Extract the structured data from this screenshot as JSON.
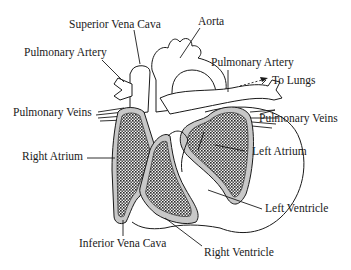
{
  "diagram": {
    "labels": {
      "superior_vena_cava": "Superior Vena Cava",
      "aorta": "Aorta",
      "pulmonary_artery_left": "Pulmonary Artery",
      "pulmonary_artery_right": "Pulmonary Artery",
      "to_lungs": "To Lungs",
      "pulmonary_veins_left": "Pulmonary Veins",
      "pulmonary_veins_right": "Pulmonary Veins",
      "right_atrium": "Right Atrium",
      "left_atrium": "Left Atrium",
      "left_ventricle": "Left Ventricle",
      "inferior_vena_cava": "Inferior Vena Cava",
      "right_ventricle": "Right Ventricle"
    },
    "colors": {
      "outline": "#1a1a1a",
      "chamber_fill": "#9a9a9a",
      "wall_fill": "#c8c8c8",
      "background": "#ffffff"
    }
  }
}
